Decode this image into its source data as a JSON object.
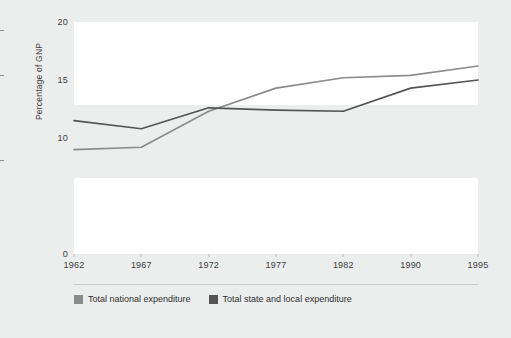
{
  "chart_data": {
    "type": "line",
    "title": "",
    "xlabel": "",
    "ylabel": "Percentage of GNP",
    "categories": [
      "1962",
      "1967",
      "1972",
      "1977",
      "1982",
      "1990",
      "1995"
    ],
    "ylim": [
      0,
      20
    ],
    "yticks": [
      "0",
      "10",
      "15",
      "20"
    ],
    "ytick_values": [
      0,
      10,
      15,
      20
    ],
    "grid": false,
    "banded_background": true,
    "legend_position": "bottom-left",
    "series": [
      {
        "name": "Total national expenditure",
        "color": "#8a8b8b",
        "values": [
          9.0,
          9.2,
          12.3,
          14.3,
          15.2,
          15.4,
          16.2
        ]
      },
      {
        "name": "Total state and local expenditure",
        "color": "#545454",
        "values": [
          11.5,
          10.8,
          12.6,
          12.4,
          12.3,
          14.3,
          15.0
        ]
      }
    ]
  },
  "legend": {
    "items": [
      {
        "label": "Total national expenditure",
        "color": "#8a8b8b"
      },
      {
        "label": "Total state and local expenditure",
        "color": "#545454"
      }
    ]
  }
}
